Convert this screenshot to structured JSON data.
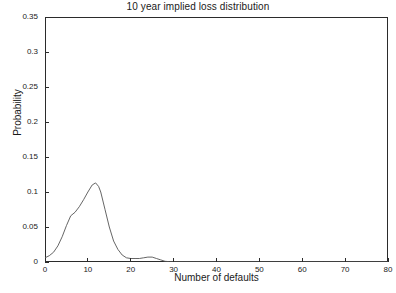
{
  "chart_data": {
    "type": "line",
    "title": "10 year implied loss distribution",
    "xlabel": "Number of defaults",
    "ylabel": "Probability",
    "xlim": [
      0,
      80
    ],
    "ylim": [
      0,
      0.35
    ],
    "xticks": [
      0,
      10,
      20,
      30,
      40,
      50,
      60,
      70,
      80
    ],
    "xtick_labels": [
      "0",
      "10",
      "20",
      "30",
      "40",
      "50",
      "60",
      "70",
      "80"
    ],
    "yticks": [
      0,
      0.05,
      0.1,
      0.15,
      0.2,
      0.25,
      0.3,
      0.35
    ],
    "ytick_labels": [
      "0",
      "0.05",
      "0.1",
      "0.15",
      "0.2",
      "0.25",
      "0.3",
      "0.35"
    ],
    "grid": false,
    "legend": null,
    "line_color": "#555555",
    "line_width": 0.8,
    "series": [
      {
        "name": "implied loss distribution",
        "x": [
          0,
          1,
          2,
          3,
          4,
          5,
          6,
          7,
          8,
          9,
          10,
          11,
          11.8,
          12.5,
          13,
          14,
          15,
          16,
          17,
          18,
          19,
          20,
          21,
          22,
          23,
          24,
          25,
          26,
          27,
          28,
          29,
          30,
          35,
          40,
          45,
          50,
          55,
          60,
          65,
          70,
          75,
          80
        ],
        "y": [
          0.006,
          0.009,
          0.014,
          0.023,
          0.036,
          0.052,
          0.066,
          0.071,
          0.079,
          0.089,
          0.1,
          0.11,
          0.113,
          0.108,
          0.1,
          0.075,
          0.05,
          0.03,
          0.018,
          0.01,
          0.006,
          0.005,
          0.005,
          0.005,
          0.006,
          0.007,
          0.007,
          0.005,
          0.003,
          0.001,
          0.0005,
          0.0003,
          0.0002,
          0.0001,
          0.0001,
          0.0001,
          0.0001,
          0.0001,
          0.0001,
          0.0001,
          0.0001,
          0.0001
        ]
      }
    ],
    "peak": {
      "x": 11.8,
      "y": 0.113
    },
    "annotations": []
  },
  "figure": {
    "background": "#ffffff",
    "axis_color": "#2b2b2b"
  }
}
